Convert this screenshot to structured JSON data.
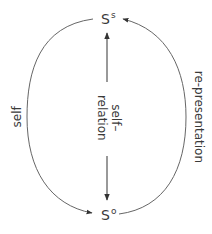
{
  "diagram": {
    "nodes": {
      "top": {
        "base": "S",
        "sup": "s"
      },
      "bottom": {
        "base": "S",
        "sup": "o"
      }
    },
    "edges": {
      "left": {
        "label": "self",
        "from": "bottom",
        "to": "top",
        "direction": "top-to-bottom (arrow at Sᵒ)"
      },
      "right": {
        "label": "re-presentation",
        "from": "bottom",
        "to": "top"
      },
      "center": {
        "label_line1": "self–",
        "label_line2": "relation",
        "bidirectional": true
      }
    },
    "colors": {
      "stroke": "#555555",
      "text": "#3a3a3a"
    }
  }
}
